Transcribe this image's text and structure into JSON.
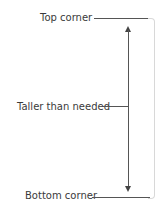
{
  "diagram": {
    "labels": {
      "top": "Top corner",
      "middle": "Taller than needed",
      "bottom": "Bottom corner"
    },
    "elements": {
      "bracket": "rounded-right-edge",
      "arrow": "double-headed-vertical-arrow"
    },
    "colors": {
      "line": "#555555",
      "bracket": "#d8d8d8",
      "text": "#3a3a3a"
    }
  }
}
